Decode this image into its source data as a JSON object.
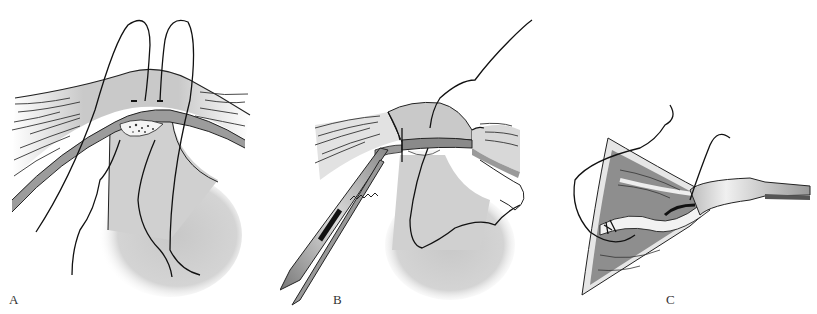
{
  "figure": {
    "panels": [
      {
        "id": "A",
        "label": "A",
        "description": "Sutures passed through band and tissue over rounded mass"
      },
      {
        "id": "B",
        "label": "B",
        "description": "Band divided with forceps clamp, suture tied"
      },
      {
        "id": "C",
        "label": "C",
        "description": "Retractor exposing incision with sutures placed"
      }
    ],
    "colors": {
      "line": "#111111",
      "band_light": "#d6d6d6",
      "band_dark": "#9a9a9a",
      "mass": "#cfcfcf",
      "background": "#ffffff"
    }
  }
}
